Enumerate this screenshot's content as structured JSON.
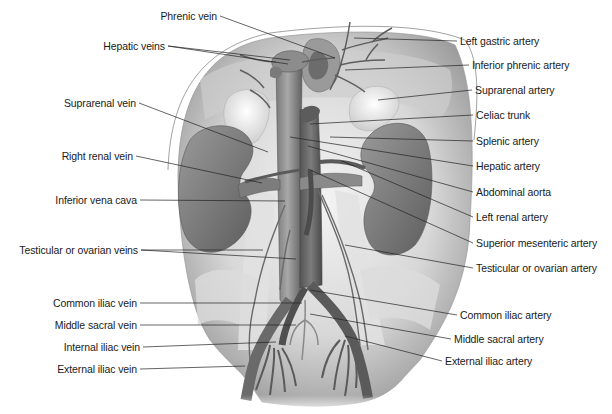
{
  "figure": {
    "colors": {
      "background": "#ffffff",
      "tissue_light": "#e4e4e4",
      "tissue_mid": "#bdbdbd",
      "vessel_dark": "#6e6e6e",
      "kidney": "#8a8a8a",
      "adrenal": "#f0f0f0",
      "leader_line": "#222222",
      "label_text": "#1a1a1a"
    }
  },
  "labels_left": [
    {
      "id": "phrenic-vein",
      "text": "Phrenic vein",
      "x": 217,
      "y": 16,
      "tx": 335,
      "ty": 58
    },
    {
      "id": "hepatic-veins",
      "text": "Hepatic veins",
      "x": 165,
      "y": 46,
      "tx": 290,
      "ty": 60,
      "tx2": 288,
      "ty2": 64
    },
    {
      "id": "suprarenal-vein",
      "text": "Suprarenal vein",
      "x": 136,
      "y": 103,
      "tx": 268,
      "ty": 152
    },
    {
      "id": "right-renal-vein",
      "text": "Right renal vein",
      "x": 133,
      "y": 156,
      "tx": 262,
      "ty": 183
    },
    {
      "id": "inferior-vena-cava",
      "text": "Inferior vena cava",
      "x": 137,
      "y": 200,
      "tx": 285,
      "ty": 201
    },
    {
      "id": "testicular-or-ovarian-veins",
      "text": "Testicular or ovarian veins",
      "x": 138,
      "y": 250,
      "tx": 263,
      "ty": 250,
      "tx2": 296,
      "ty2": 259
    },
    {
      "id": "common-iliac-vein",
      "text": "Common iliac vein",
      "x": 137,
      "y": 303,
      "tx": 302,
      "ty": 303
    },
    {
      "id": "middle-sacral-vein",
      "text": "Middle sacral vein",
      "x": 137,
      "y": 325,
      "tx": 296,
      "ty": 325
    },
    {
      "id": "internal-iliac-vein",
      "text": "Internal iliac vein",
      "x": 140,
      "y": 347,
      "tx": 276,
      "ty": 342
    },
    {
      "id": "external-iliac-vein",
      "text": "External iliac vein",
      "x": 137,
      "y": 369,
      "tx": 245,
      "ty": 366
    }
  ],
  "labels_right": [
    {
      "id": "left-gastric-artery",
      "text": "Left gastric artery",
      "x": 460,
      "y": 41,
      "tx": 354,
      "ty": 38
    },
    {
      "id": "inferior-phrenic-artery",
      "text": "Inferior phrenic artery",
      "x": 472,
      "y": 65,
      "tx": 345,
      "ty": 70
    },
    {
      "id": "suprarenal-artery",
      "text": "Suprarenal artery",
      "x": 475,
      "y": 90,
      "tx": 378,
      "ty": 100
    },
    {
      "id": "celiac-trunk",
      "text": "Celiac trunk",
      "x": 476,
      "y": 115,
      "tx": 310,
      "ty": 124
    },
    {
      "id": "splenic-artery",
      "text": "Splenic artery",
      "x": 476,
      "y": 141,
      "tx": 330,
      "ty": 137
    },
    {
      "id": "hepatic-artery",
      "text": "Hepatic artery",
      "x": 476,
      "y": 166,
      "tx": 290,
      "ty": 137
    },
    {
      "id": "abdominal-aorta",
      "text": "Abdominal aorta",
      "x": 476,
      "y": 192,
      "tx": 308,
      "ty": 146
    },
    {
      "id": "left-renal-artery",
      "text": "Left renal artery",
      "x": 476,
      "y": 217,
      "tx": 342,
      "ty": 161
    },
    {
      "id": "superior-mesenteric-artery",
      "text": "Superior mesenteric artery",
      "x": 476,
      "y": 243,
      "tx": 308,
      "ty": 169
    },
    {
      "id": "testicular-or-ovarian-artery",
      "text": "Testicular or ovarian artery",
      "x": 476,
      "y": 268,
      "tx": 345,
      "ty": 245
    },
    {
      "id": "common-iliac-artery",
      "text": "Common iliac artery",
      "x": 460,
      "y": 315,
      "tx": 310,
      "ty": 290
    },
    {
      "id": "middle-sacral-artery",
      "text": "Middle sacral artery",
      "x": 454,
      "y": 339,
      "tx": 310,
      "ty": 314
    },
    {
      "id": "external-iliac-artery",
      "text": "External iliac artery",
      "x": 445,
      "y": 361,
      "tx": 345,
      "ty": 336
    }
  ]
}
